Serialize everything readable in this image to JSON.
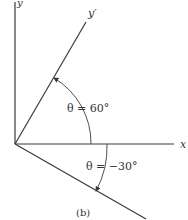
{
  "figure": {
    "caption": "(b)",
    "axes": {
      "x_label": "x",
      "y_label": "y",
      "rotated_label": "y′"
    },
    "angles": [
      {
        "label": "θ = 60°",
        "theta_deg": 60
      },
      {
        "label": "θ = −30°",
        "theta_deg": -30
      }
    ],
    "colors": {
      "line": "#3a3a3a",
      "text": "#333333",
      "background": "#ffffff"
    }
  }
}
